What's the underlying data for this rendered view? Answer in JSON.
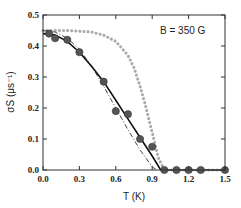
{
  "chart_data": {
    "type": "scatter",
    "title": "",
    "annotation": "B = 350 G",
    "xlabel": "T (K)",
    "ylabel": "σS (μs⁻¹)",
    "xlim": [
      0.0,
      1.5
    ],
    "ylim": [
      0.0,
      0.5
    ],
    "xticks": [
      "0.0",
      "0.3",
      "0.6",
      "0.9",
      "1.2",
      "1.5"
    ],
    "yticks": [
      "0.0",
      "0.1",
      "0.2",
      "0.3",
      "0.4",
      "0.5"
    ],
    "grid": false,
    "legend": null,
    "series": [
      {
        "name": "data",
        "kind": "markers",
        "color": "#555555",
        "x": [
          0.05,
          0.1,
          0.2,
          0.3,
          0.5,
          0.6,
          0.7,
          0.8,
          0.9,
          1.0,
          1.1,
          1.2,
          1.3,
          1.5
        ],
        "y": [
          0.44,
          0.425,
          0.42,
          0.38,
          0.285,
          0.19,
          0.18,
          0.1,
          0.075,
          0.0,
          0.0,
          0.0,
          0.0,
          0.0
        ]
      },
      {
        "name": "solid fit",
        "kind": "solid-line",
        "color": "#111111",
        "x": [
          0.0,
          0.1,
          0.2,
          0.3,
          0.4,
          0.5,
          0.6,
          0.7,
          0.8,
          0.9,
          0.97,
          1.5
        ],
        "y": [
          0.44,
          0.435,
          0.415,
          0.38,
          0.335,
          0.285,
          0.225,
          0.165,
          0.105,
          0.045,
          0.0,
          0.0
        ]
      },
      {
        "name": "dash-dot fit",
        "kind": "dash-dot-line",
        "color": "#333333",
        "x": [
          0.0,
          0.1,
          0.2,
          0.3,
          0.4,
          0.5,
          0.6,
          0.7,
          0.8,
          0.9,
          0.94
        ],
        "y": [
          0.45,
          0.445,
          0.425,
          0.39,
          0.335,
          0.27,
          0.2,
          0.13,
          0.065,
          0.01,
          0.0
        ]
      },
      {
        "name": "dotted gray curve",
        "kind": "dotted-line",
        "color": "#aaaaaa",
        "x": [
          0.0,
          0.2,
          0.4,
          0.5,
          0.6,
          0.7,
          0.75,
          0.8,
          0.85,
          0.9,
          0.95,
          1.0,
          1.5
        ],
        "y": [
          0.45,
          0.45,
          0.445,
          0.435,
          0.415,
          0.37,
          0.33,
          0.27,
          0.2,
          0.12,
          0.04,
          0.0,
          0.0
        ]
      }
    ]
  }
}
